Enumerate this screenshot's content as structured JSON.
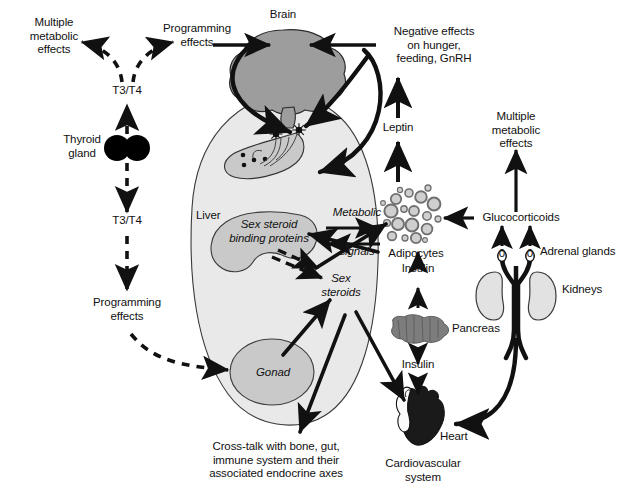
{
  "figure": {
    "background": "#ffffff",
    "width": 623,
    "height": 500
  },
  "palette": {
    "stroke": "#111111",
    "brain_fill": "#9d9d9d",
    "body_fill": "#e9e9e9",
    "organ_fill": "#c9c9c9",
    "kidney_fill": "#e2e2e2",
    "pancreas_fill": "#7d7d7d",
    "heart_fill": "#1a1a1a",
    "thyroid_fill": "#000000",
    "adipocyte_fill": "#cfcfcf",
    "adipocyte_ring": "#6f6f6f"
  },
  "labels": {
    "multiple_metabolic_effects_left": "Multiple\nmetabolic\neffects",
    "programming_effects_top": "Programming\neffects",
    "brain": "Brain",
    "negative_effects": "Negative effects\non hunger,\nfeeding, GnRH",
    "multiple_metabolic_effects_right": "Multiple\nmetabolic\neffects",
    "t3t4_top": "T3/T4",
    "t3t4_bottom": "T3/T4",
    "thyroid_gland": "Thyroid\ngland",
    "programming_effects_bottom": "Programming\neffects",
    "leptin": "Leptin",
    "liver": "Liver",
    "sex_steroid_binding_proteins": "Sex steroid\nbinding proteins",
    "metabolic": "Metabolic",
    "signals": "signals",
    "adipocytes": "Adipocytes",
    "glucocorticoids": "Glucocorticoids",
    "adrenal_glands": "Adrenal glands",
    "kidneys": "Kidneys",
    "sex_steroids": "Sex\nsteroids",
    "insulin_upper": "Insulin",
    "insulin_lower": "Insulin",
    "pancreas": "Pancreas",
    "gonad": "Gonad",
    "heart": "Heart",
    "cardiovascular_system": "Cardiovascular\nsystem",
    "cross_talk": "Cross-talk with bone, gut,\nimmune system and their\nassociated endocrine axes",
    "adrenal_marker_left": "0",
    "adrenal_marker_right": "0"
  }
}
